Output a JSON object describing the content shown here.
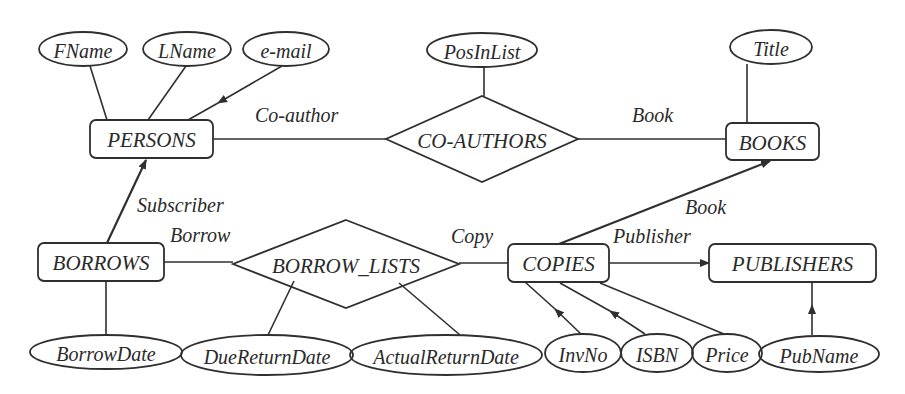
{
  "entities": [
    {
      "id": "persons",
      "label": "PERSONS",
      "x": 90,
      "y": 120,
      "w": 123,
      "h": 38
    },
    {
      "id": "books",
      "label": "BOOKS",
      "x": 726,
      "y": 123,
      "w": 93,
      "h": 37
    },
    {
      "id": "borrows",
      "label": "BORROWS",
      "x": 38,
      "y": 243,
      "w": 126,
      "h": 38
    },
    {
      "id": "copies",
      "label": "COPIES",
      "x": 508,
      "y": 244,
      "w": 101,
      "h": 38
    },
    {
      "id": "publishers",
      "label": "PUBLISHERS",
      "x": 709,
      "y": 244,
      "w": 167,
      "h": 38
    }
  ],
  "relationships": [
    {
      "id": "co-authors",
      "label": "CO-AUTHORS",
      "cx": 482,
      "cy": 139,
      "hw": 96,
      "hh": 43
    },
    {
      "id": "borrow-lists",
      "label": "BORROW_LISTS",
      "cx": 346,
      "cy": 264,
      "hw": 113,
      "hh": 44
    }
  ],
  "attributes": [
    {
      "id": "fname",
      "label": "FName",
      "cx": 83,
      "cy": 49,
      "rx": 44,
      "ry": 17
    },
    {
      "id": "lname",
      "label": "LName",
      "cx": 187,
      "cy": 49,
      "rx": 44,
      "ry": 17
    },
    {
      "id": "email",
      "label": "e-mail",
      "cx": 286,
      "cy": 49,
      "rx": 43,
      "ry": 17
    },
    {
      "id": "posinlist",
      "label": "PosInList",
      "cx": 482,
      "cy": 50,
      "rx": 55,
      "ry": 17
    },
    {
      "id": "title",
      "label": "Title",
      "cx": 771,
      "cy": 47,
      "rx": 41,
      "ry": 17
    },
    {
      "id": "borrowdate",
      "label": "BorrowDate",
      "cx": 106,
      "cy": 352,
      "rx": 76,
      "ry": 17
    },
    {
      "id": "duereturndate",
      "label": "DueReturnDate",
      "cx": 267,
      "cy": 355,
      "rx": 86,
      "ry": 20
    },
    {
      "id": "actualreturndate",
      "label": "ActualReturnDate",
      "cx": 446,
      "cy": 355,
      "rx": 96,
      "ry": 20
    },
    {
      "id": "invno",
      "label": "InvNo",
      "cx": 583,
      "cy": 353,
      "rx": 38,
      "ry": 19
    },
    {
      "id": "isbn",
      "label": "ISBN",
      "cx": 657,
      "cy": 353,
      "rx": 36,
      "ry": 19
    },
    {
      "id": "price",
      "label": "Price",
      "cx": 727,
      "cy": 353,
      "rx": 35,
      "ry": 19
    },
    {
      "id": "pubname",
      "label": "PubName",
      "cx": 819,
      "cy": 354,
      "rx": 60,
      "ry": 18
    }
  ],
  "roles": [
    {
      "id": "role-coauthor",
      "label": "Co-author",
      "x": 255,
      "y": 122
    },
    {
      "id": "role-book-top",
      "label": "Book",
      "x": 632,
      "y": 122
    },
    {
      "id": "role-subscriber",
      "label": "Subscriber",
      "x": 137,
      "y": 212
    },
    {
      "id": "role-borrow",
      "label": "Borrow",
      "x": 170,
      "y": 242
    },
    {
      "id": "role-copy",
      "label": "Copy",
      "x": 451,
      "y": 243
    },
    {
      "id": "role-book-bottom",
      "label": "Book",
      "x": 685,
      "y": 214
    },
    {
      "id": "role-publisher",
      "label": "Publisher",
      "x": 613,
      "y": 243
    }
  ],
  "edges": [
    {
      "id": "fname-persons",
      "x1": 90,
      "y1": 66,
      "x2": 107,
      "y2": 120,
      "arrow": false
    },
    {
      "id": "lname-persons",
      "x1": 186,
      "y1": 66,
      "x2": 148,
      "y2": 120,
      "arrow": false
    },
    {
      "id": "email-persons",
      "x1": 282,
      "y1": 66,
      "x2": 188,
      "y2": 120,
      "arrow": true,
      "ax": 218,
      "ay": 103
    },
    {
      "id": "persons-coauthors",
      "x1": 213,
      "y1": 139,
      "x2": 386,
      "y2": 139,
      "arrow": false
    },
    {
      "id": "posinlist-coauthors",
      "x1": 484,
      "y1": 67,
      "x2": 484,
      "y2": 97,
      "arrow": false
    },
    {
      "id": "coauthors-books",
      "x1": 578,
      "y1": 139,
      "x2": 726,
      "y2": 139,
      "arrow": false
    },
    {
      "id": "title-books",
      "x1": 747,
      "y1": 64,
      "x2": 747,
      "y2": 123,
      "arrow": false
    },
    {
      "id": "borrows-persons",
      "x1": 107,
      "y1": 243,
      "x2": 146,
      "y2": 160,
      "arrow": true,
      "bold": true,
      "ax": 146,
      "ay": 160
    },
    {
      "id": "borrows-borrowlists",
      "x1": 164,
      "y1": 262,
      "x2": 233,
      "y2": 262,
      "arrow": false
    },
    {
      "id": "borrows-borrowdate",
      "x1": 106,
      "y1": 281,
      "x2": 106,
      "y2": 335,
      "arrow": false
    },
    {
      "id": "borrowlists-duereturn",
      "x1": 294,
      "y1": 281,
      "x2": 268,
      "y2": 335,
      "arrow": false
    },
    {
      "id": "borrowlists-actualreturn",
      "x1": 399,
      "y1": 283,
      "x2": 460,
      "y2": 335,
      "arrow": false
    },
    {
      "id": "borrowlists-copies",
      "x1": 459,
      "y1": 263,
      "x2": 508,
      "y2": 263,
      "arrow": false
    },
    {
      "id": "copies-books",
      "x1": 559,
      "y1": 244,
      "x2": 770,
      "y2": 161,
      "arrow": true,
      "bold": true,
      "ax": 770,
      "ay": 161
    },
    {
      "id": "copies-publishers",
      "x1": 609,
      "y1": 263,
      "x2": 709,
      "y2": 263,
      "arrow": true,
      "ax": 709,
      "ay": 263
    },
    {
      "id": "invno-copies",
      "x1": 581,
      "y1": 334,
      "x2": 525,
      "y2": 282,
      "arrow": true,
      "ax": 555,
      "ay": 309
    },
    {
      "id": "isbn-copies",
      "x1": 645,
      "y1": 334,
      "x2": 560,
      "y2": 283,
      "arrow": true,
      "ax": 610,
      "ay": 311
    },
    {
      "id": "price-copies",
      "x1": 724,
      "y1": 334,
      "x2": 600,
      "y2": 283,
      "arrow": false
    },
    {
      "id": "pubname-publishers",
      "x1": 812,
      "y1": 335,
      "x2": 812,
      "y2": 282,
      "arrow": true,
      "ax": 812,
      "ay": 305
    }
  ]
}
